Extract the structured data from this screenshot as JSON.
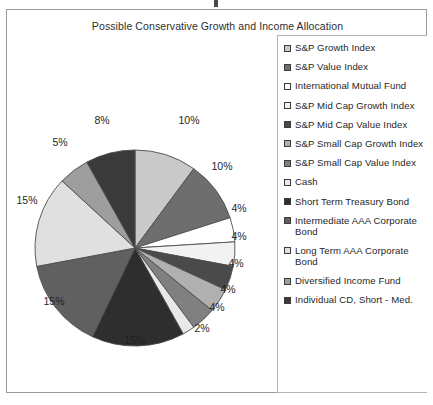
{
  "chart_data": {
    "type": "pie",
    "title": "Possible Conservative Growth and Income Allocation",
    "categories": [
      "S&P Growth Index",
      "S&P Value Index",
      "International Mutual Fund",
      "S&P Mid Cap Growth Index",
      "S&P Mid Cap Value Index",
      "S&P Small Cap Growth Index",
      "S&P Small Cap Value Index",
      "Cash",
      "Short Term Treasury Bond",
      "Intermediate AAA Corporate Bond",
      "Long Term AAA Corporate Bond",
      "Diversified Income Fund",
      "Individual CD, Short - Med."
    ],
    "values": [
      10,
      10,
      4,
      4,
      4,
      4,
      4,
      2,
      15,
      15,
      15,
      5,
      8
    ],
    "value_labels": [
      "10%",
      "10%",
      "4%",
      "4%",
      "4%",
      "4%",
      "4%",
      "2%",
      "15%",
      "15%",
      "15%",
      "5%",
      "8%"
    ],
    "colors": [
      "#c9c9c9",
      "#6e6e6e",
      "#ffffff",
      "#f2f2f2",
      "#4a4a4a",
      "#b0b0b0",
      "#808080",
      "#e8e8e8",
      "#2e2e2e",
      "#606060",
      "#e0e0e0",
      "#9e9e9e",
      "#3a3a3a"
    ],
    "legend_position": "right",
    "grid": false,
    "xlabel": "",
    "ylabel": ""
  },
  "legend": {
    "items": [
      {
        "label": "S&P Growth Index",
        "color": "#c9c9c9"
      },
      {
        "label": "S&P Value Index",
        "color": "#6e6e6e"
      },
      {
        "label": "International Mutual Fund",
        "color": "#ffffff"
      },
      {
        "label": "S&P Mid Cap Growth Index",
        "color": "#f2f2f2"
      },
      {
        "label": "S&P Mid Cap Value Index",
        "color": "#4a4a4a"
      },
      {
        "label": "S&P Small Cap Growth Index",
        "color": "#b0b0b0"
      },
      {
        "label": "S&P Small Cap Value Index",
        "color": "#808080"
      },
      {
        "label": "Cash",
        "color": "#e8e8e8"
      },
      {
        "label": "Short Term Treasury Bond",
        "color": "#2e2e2e"
      },
      {
        "label": "Intermediate AAA Corporate Bond",
        "color": "#606060"
      },
      {
        "label": "Long Term AAA Corporate Bond",
        "color": "#e0e0e0"
      },
      {
        "label": "Diversified Income Fund",
        "color": "#9e9e9e"
      },
      {
        "label": "Individual CD, Short - Med.",
        "color": "#3a3a3a"
      }
    ]
  },
  "labels": [
    {
      "text": "10%",
      "x": 182,
      "y": 110
    },
    {
      "text": "10%",
      "x": 215,
      "y": 156
    },
    {
      "text": "4%",
      "x": 232,
      "y": 198
    },
    {
      "text": "4%",
      "x": 232,
      "y": 226
    },
    {
      "text": "4%",
      "x": 229,
      "y": 253
    },
    {
      "text": "4%",
      "x": 221,
      "y": 279
    },
    {
      "text": "4%",
      "x": 210,
      "y": 297
    },
    {
      "text": "2%",
      "x": 195,
      "y": 318
    },
    {
      "text": "15%",
      "x": 128,
      "y": 330
    },
    {
      "text": "15%",
      "x": 47,
      "y": 291
    },
    {
      "text": "15%",
      "x": 20,
      "y": 190
    },
    {
      "text": "5%",
      "x": 53,
      "y": 132
    },
    {
      "text": "8%",
      "x": 95,
      "y": 110
    }
  ]
}
